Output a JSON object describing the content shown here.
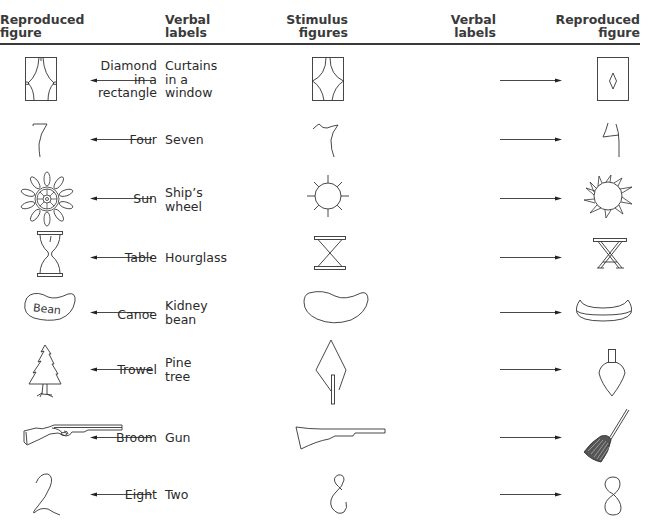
{
  "headers": {
    "reproduced_left": [
      "Reproduced",
      "figure"
    ],
    "verbal_left": [
      "Verbal",
      "labels"
    ],
    "stimulus": [
      "Stimulus",
      "figures"
    ],
    "verbal_right": [
      "Verbal",
      "labels"
    ],
    "reproduced_right": [
      "Reproduced",
      "figure"
    ]
  },
  "rows": [
    {
      "stimulus": "curtain-diamond-icon",
      "left_label": [
        "Curtains",
        "in a",
        "window"
      ],
      "left_reproduced": "curtains-window-icon",
      "right_label": [
        "Diamond",
        "in a",
        "rectangle"
      ],
      "right_reproduced": "diamond-rectangle-icon"
    },
    {
      "stimulus": "seven-four-icon",
      "left_label": [
        "Seven"
      ],
      "left_reproduced": "seven-icon",
      "right_label": [
        "Four"
      ],
      "right_reproduced": "four-icon"
    },
    {
      "stimulus": "wheel-sun-icon",
      "left_label": [
        "Ship’s",
        "wheel"
      ],
      "left_reproduced": "ships-wheel-icon",
      "right_label": [
        "Sun"
      ],
      "right_reproduced": "sun-icon"
    },
    {
      "stimulus": "hourglass-table-icon",
      "left_label": [
        "Hourglass"
      ],
      "left_reproduced": "hourglass-icon",
      "right_label": [
        "Table"
      ],
      "right_reproduced": "table-icon"
    },
    {
      "stimulus": "bean-canoe-icon",
      "left_label": [
        "Kidney",
        "bean"
      ],
      "left_reproduced": "kidney-bean-icon",
      "left_reproduced_text": "Bean",
      "right_label": [
        "Canoe"
      ],
      "right_reproduced": "canoe-icon"
    },
    {
      "stimulus": "tree-trowel-icon",
      "left_label": [
        "Pine",
        "tree"
      ],
      "left_reproduced": "pine-tree-icon",
      "right_label": [
        "Trowel"
      ],
      "right_reproduced": "trowel-icon"
    },
    {
      "stimulus": "gun-broom-icon",
      "left_label": [
        "Gun"
      ],
      "left_reproduced": "gun-icon",
      "right_label": [
        "Broom"
      ],
      "right_reproduced": "broom-icon"
    },
    {
      "stimulus": "two-eight-icon",
      "left_label": [
        "Two"
      ],
      "left_reproduced": "two-icon",
      "right_label": [
        "Eight"
      ],
      "right_reproduced": "eight-icon"
    }
  ]
}
